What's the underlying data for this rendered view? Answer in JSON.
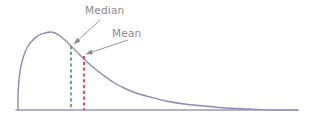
{
  "chart_data": {
    "type": "line",
    "title": "",
    "subtitle": "",
    "xlabel": "",
    "ylabel": "",
    "grid": false,
    "legend": "none",
    "xlim": [
      0,
      320
    ],
    "ylim": [
      0,
      124
    ],
    "series": [
      {
        "name": "distribution-curve",
        "color": "#8d89b8",
        "points": [
          [
            18,
            110
          ],
          [
            18,
            96
          ],
          [
            19,
            80
          ],
          [
            21,
            66
          ],
          [
            24,
            55
          ],
          [
            28,
            46
          ],
          [
            33,
            40
          ],
          [
            39,
            35
          ],
          [
            45,
            33
          ],
          [
            50,
            32
          ],
          [
            55,
            33
          ],
          [
            60,
            36
          ],
          [
            66,
            41
          ],
          [
            72,
            47
          ],
          [
            79,
            54
          ],
          [
            86,
            61
          ],
          [
            94,
            68
          ],
          [
            103,
            75
          ],
          [
            113,
            82
          ],
          [
            124,
            88
          ],
          [
            136,
            93
          ],
          [
            150,
            97
          ],
          [
            166,
            101
          ],
          [
            184,
            104
          ],
          [
            204,
            106
          ],
          [
            226,
            108
          ],
          [
            250,
            109
          ],
          [
            275,
            110
          ],
          [
            298,
            110
          ]
        ]
      }
    ],
    "axis_line": {
      "name": "baseline",
      "color": "#9c99bb",
      "from": [
        16,
        110
      ],
      "to": [
        298,
        110
      ]
    },
    "markers": [
      {
        "name": "median",
        "label": "Median",
        "x": 71,
        "y_top": 46,
        "y_bottom": 110,
        "color": "#3e9e4e",
        "style": "dashed"
      },
      {
        "name": "mean",
        "label": "Mean",
        "x": 84,
        "y_top": 56,
        "y_bottom": 110,
        "color": "#d62b2b",
        "style": "dashed"
      }
    ],
    "annotations": [
      {
        "name": "median-annotation",
        "text": "Median",
        "text_x": 85,
        "text_y": 4,
        "arrow_from": [
          100,
          20
        ],
        "arrow_to": [
          74,
          44
        ],
        "color": "#8a8a8a"
      },
      {
        "name": "mean-annotation",
        "text": "Mean",
        "text_x": 112,
        "text_y": 27,
        "arrow_from": [
          128,
          40
        ],
        "arrow_to": [
          86,
          54
        ],
        "color": "#8a8a8a"
      }
    ]
  },
  "labels": {
    "median": "Median",
    "mean": "Mean"
  },
  "colors": {
    "curve": "#8d89b8",
    "baseline": "#9c99bb",
    "median_line": "#3e9e4e",
    "mean_line": "#d62b2b",
    "annotation_text": "#8a8a8a",
    "background": "#ffffff"
  }
}
